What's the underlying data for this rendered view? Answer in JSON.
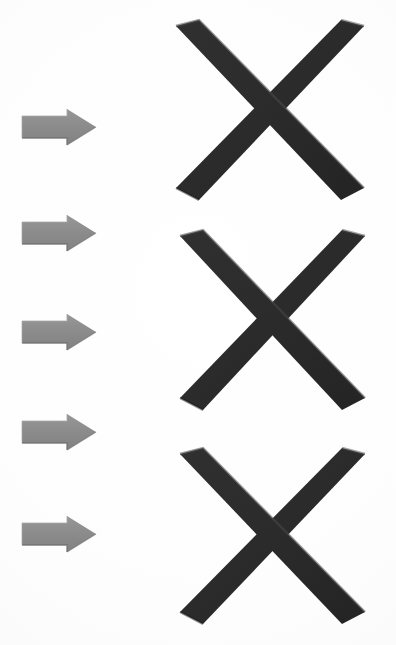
{
  "scene": {
    "title": "Arrows and X marks",
    "background_color": "#fdfdfd",
    "width": 396,
    "height": 645
  },
  "palette": {
    "arrow_fill": "#8b8b8b",
    "arrow_fill_light": "#9a9a9a",
    "arrow_fill_dark": "#7a7a7a",
    "arrow_edge_highlight": "#a6a6a6",
    "arrow_edge_shadow": "#6f6f6f",
    "x_fill": "#2b2b2b",
    "x_fill_light": "#3a3a3a",
    "x_fill_dark": "#1e1e1e",
    "x_edge_highlight": "#4a4a4a",
    "background": "#fdfdfd"
  },
  "arrows": [
    {
      "id": "arrow-1",
      "label": "Arrow 1",
      "icon": "right-arrow-icon",
      "x": 21,
      "y": 108,
      "width": 76,
      "height": 38
    },
    {
      "id": "arrow-2",
      "label": "Arrow 2",
      "icon": "right-arrow-icon",
      "x": 21,
      "y": 214,
      "width": 76,
      "height": 38
    },
    {
      "id": "arrow-3",
      "label": "Arrow 3",
      "icon": "right-arrow-icon",
      "x": 21,
      "y": 313,
      "width": 76,
      "height": 38
    },
    {
      "id": "arrow-4",
      "label": "Arrow 4",
      "icon": "right-arrow-icon",
      "x": 21,
      "y": 413,
      "width": 76,
      "height": 38
    },
    {
      "id": "arrow-5",
      "label": "Arrow 5",
      "icon": "right-arrow-icon",
      "x": 21,
      "y": 515,
      "width": 76,
      "height": 38
    }
  ],
  "xmarks": [
    {
      "id": "x-1",
      "label": "X mark 1",
      "icon": "x-cross-icon",
      "x": 172,
      "y": 18,
      "width": 196,
      "height": 186
    },
    {
      "id": "x-2",
      "label": "X mark 2",
      "icon": "x-cross-icon",
      "x": 176,
      "y": 228,
      "width": 193,
      "height": 186
    },
    {
      "id": "x-3",
      "label": "X mark 3",
      "icon": "x-cross-icon",
      "x": 176,
      "y": 446,
      "width": 193,
      "height": 182
    }
  ]
}
